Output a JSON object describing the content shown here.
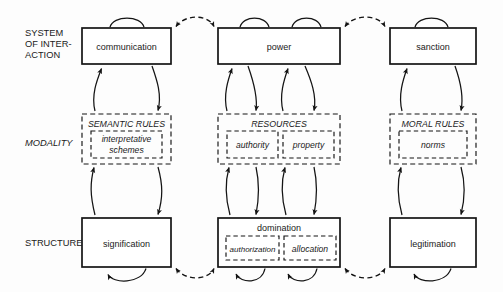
{
  "diagram": {
    "rows": [
      {
        "id": "interaction",
        "label_lines": [
          "SYSTEM",
          "OF INTER-",
          "ACTION"
        ],
        "style": "upright"
      },
      {
        "id": "modality",
        "label_lines": [
          "MODALITY"
        ],
        "style": "italic"
      },
      {
        "id": "structure",
        "label_lines": [
          "STRUCTURE"
        ],
        "style": "upright"
      }
    ],
    "columns": [
      {
        "id": "signification",
        "interaction": {
          "label": "communication"
        },
        "modality": {
          "label": "SEMANTIC RULES",
          "inner": [
            {
              "label_lines": [
                "interpretative",
                "schemes"
              ]
            }
          ]
        },
        "structure": {
          "label": "signification",
          "inner": []
        }
      },
      {
        "id": "domination",
        "interaction": {
          "label": "power"
        },
        "modality": {
          "label": "RESOURCES",
          "inner": [
            {
              "label_lines": [
                "authority"
              ]
            },
            {
              "label_lines": [
                "property"
              ]
            }
          ]
        },
        "structure": {
          "label": "domination",
          "inner": [
            {
              "label_lines": [
                "authorization"
              ]
            },
            {
              "label_lines": [
                "allocation"
              ]
            }
          ]
        }
      },
      {
        "id": "legitimation",
        "interaction": {
          "label": "sanction"
        },
        "modality": {
          "label": "MORAL RULES",
          "inner": [
            {
              "label_lines": [
                "norms"
              ]
            }
          ]
        },
        "structure": {
          "label": "legitimation",
          "inner": []
        }
      }
    ],
    "colors": {
      "background": "#fdfdfd",
      "stroke": "#141414",
      "box_fill": "#ffffff",
      "text": "#1a1a1a"
    }
  }
}
